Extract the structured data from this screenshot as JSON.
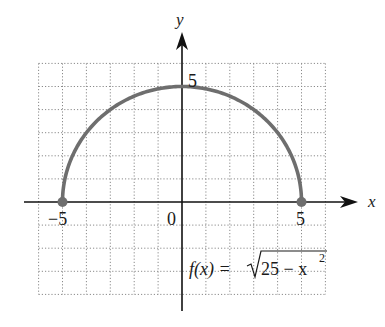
{
  "chart_data": {
    "type": "line",
    "title": "",
    "function_label": "f(x) = √25 − x²",
    "function_parts": {
      "lhs": "f(x) =",
      "radicand": "25 − x",
      "exponent": "2"
    },
    "xlabel": "x",
    "ylabel": "y",
    "xlim": [
      -6,
      6
    ],
    "ylim": [
      -4,
      6
    ],
    "grid": true,
    "grid_style": "dotted",
    "tick_labels": {
      "x": [
        {
          "value": -5,
          "label": "−5"
        },
        {
          "value": 0,
          "label": "0"
        },
        {
          "value": 5,
          "label": "5"
        }
      ],
      "y": [
        {
          "value": 5,
          "label": "5"
        }
      ]
    },
    "series": [
      {
        "name": "f(x) = sqrt(25 - x^2)",
        "kind": "semicircle",
        "radius": 5,
        "x": [
          -5,
          -4,
          -3,
          -2,
          -1,
          0,
          1,
          2,
          3,
          4,
          5
        ],
        "y": [
          0,
          3,
          4,
          4.58,
          4.9,
          5,
          4.9,
          4.58,
          4,
          3,
          0
        ],
        "endpoints": [
          {
            "x": -5,
            "y": 0,
            "closed": true
          },
          {
            "x": 5,
            "y": 0,
            "closed": true
          }
        ]
      }
    ],
    "colors": {
      "curve": "#6e6e6e",
      "axes": "#111111",
      "grid": "#8a8a8a"
    }
  }
}
